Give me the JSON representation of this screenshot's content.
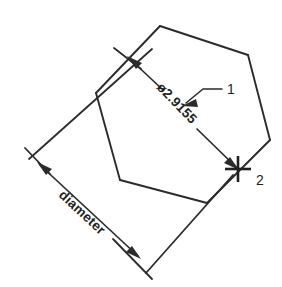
{
  "drawing": {
    "title": "Diameter dimension on pentagon",
    "background_color": "#ffffff",
    "line_color": "#2b2b2b",
    "text_color": "#1f1f1f",
    "dimensions": [
      {
        "id": "diameter-value",
        "label": "ø2.9155",
        "kind": "diameter",
        "value": 2.9155,
        "symbol": "ø",
        "rotation_deg": 46
      },
      {
        "id": "diameter-word",
        "label": "diameter",
        "kind": "annotation",
        "rotation_deg": 46
      }
    ],
    "callouts": [
      {
        "id": "callout-1",
        "label": "1"
      },
      {
        "id": "callout-2",
        "label": "2"
      }
    ],
    "shape": {
      "name": "pentagon",
      "vertices": [
        [
          160,
          26
        ],
        [
          248,
          55
        ],
        [
          270,
          140
        ],
        [
          207,
          203
        ],
        [
          120,
          180
        ],
        [
          96,
          93
        ]
      ]
    },
    "marker": {
      "name": "center-cross",
      "x": 238,
      "y": 169
    }
  }
}
